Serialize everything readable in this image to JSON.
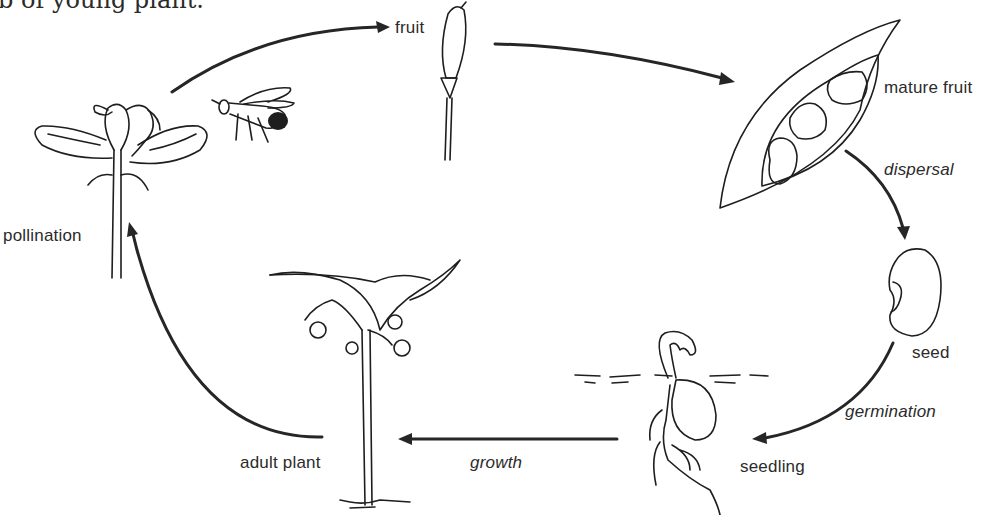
{
  "caption": {
    "text": "b of young plant."
  },
  "diagram": {
    "stages": [
      {
        "id": "pollination",
        "label": "pollination",
        "style": "normal"
      },
      {
        "id": "fruit",
        "label": "fruit",
        "style": "normal"
      },
      {
        "id": "mature_fruit",
        "label": "mature fruit",
        "style": "normal"
      },
      {
        "id": "seed",
        "label": "seed",
        "style": "normal"
      },
      {
        "id": "seedling",
        "label": "seedling",
        "style": "normal"
      },
      {
        "id": "adult_plant",
        "label": "adult plant",
        "style": "normal"
      }
    ],
    "processes": [
      {
        "id": "dispersal",
        "label": "dispersal",
        "style": "italic"
      },
      {
        "id": "germination",
        "label": "germination",
        "style": "italic"
      },
      {
        "id": "growth",
        "label": "growth",
        "style": "italic"
      }
    ],
    "arrows": [
      {
        "from": "pollination",
        "to": "fruit"
      },
      {
        "from": "fruit",
        "to": "mature_fruit"
      },
      {
        "from": "mature_fruit",
        "to": "seed",
        "process": "dispersal"
      },
      {
        "from": "seed",
        "to": "seedling",
        "process": "germination"
      },
      {
        "from": "seedling",
        "to": "adult_plant",
        "process": "growth"
      },
      {
        "from": "adult_plant",
        "to": "pollination"
      }
    ],
    "colors": {
      "ink": "#1e1e1e",
      "background": "#ffffff"
    }
  }
}
